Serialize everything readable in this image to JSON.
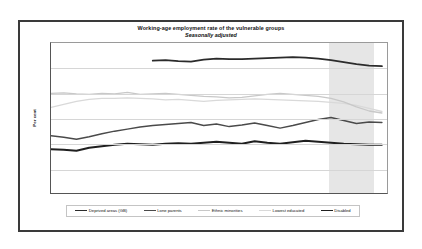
{
  "chart_data": {
    "type": "line",
    "title": "Working-age employment rate of the vulnerable groups",
    "subtitle": "Seasonally adjusted",
    "xlabel": "",
    "ylabel": "Per cent",
    "ylim": [
      40,
      70
    ],
    "yticks": [
      40,
      45,
      50,
      55,
      60,
      65,
      70
    ],
    "xlim": [
      2003.0,
      2009.6
    ],
    "xticks": [
      2003,
      2004,
      2005,
      2006,
      2007,
      2008,
      2009
    ],
    "xtick_labels": [
      "2003",
      "2004",
      "2005",
      "2006",
      "2007",
      "2008",
      "2009"
    ],
    "grid": true,
    "legend_position": "bottom",
    "shaded_region": {
      "label": "recession",
      "x_start": 2008.42,
      "x_end": 2009.3,
      "color": "#e6e6e6"
    },
    "series": [
      {
        "name": "Deprived areas (GB)",
        "color": "#2b2b2b",
        "width": 1.9,
        "x": [
          2005.0,
          2005.25,
          2005.5,
          2005.75,
          2006.0,
          2006.25,
          2006.5,
          2006.75,
          2007.0,
          2007.25,
          2007.5,
          2007.75,
          2008.0,
          2008.25,
          2008.5,
          2008.75,
          2009.0,
          2009.25,
          2009.5
        ],
        "values": [
          66.5,
          66.6,
          66.4,
          66.3,
          66.7,
          66.9,
          66.8,
          66.8,
          66.9,
          67.0,
          67.1,
          67.2,
          67.1,
          66.9,
          66.6,
          66.2,
          65.8,
          65.5,
          65.4
        ]
      },
      {
        "name": "Lone parents",
        "color": "#4a4a4a",
        "width": 1.5,
        "x": [
          2003.0,
          2003.25,
          2003.5,
          2003.75,
          2004.0,
          2004.25,
          2004.5,
          2004.75,
          2005.0,
          2005.25,
          2005.5,
          2005.75,
          2006.0,
          2006.25,
          2006.5,
          2006.75,
          2007.0,
          2007.25,
          2007.5,
          2007.75,
          2008.0,
          2008.25,
          2008.5,
          2008.75,
          2009.0,
          2009.25,
          2009.5
        ],
        "values": [
          51.6,
          51.3,
          50.9,
          51.4,
          52.0,
          52.5,
          52.9,
          53.3,
          53.6,
          53.8,
          54.0,
          54.2,
          53.6,
          53.9,
          53.4,
          53.7,
          54.1,
          53.6,
          53.1,
          53.6,
          54.2,
          54.8,
          55.2,
          54.6,
          54.0,
          54.3,
          54.2
        ]
      },
      {
        "name": "Ethnic minorities",
        "color": "#c8c8c8",
        "width": 1.3,
        "x": [
          2003.0,
          2003.25,
          2003.5,
          2003.75,
          2004.0,
          2004.25,
          2004.5,
          2004.75,
          2005.0,
          2005.25,
          2005.5,
          2005.75,
          2006.0,
          2006.25,
          2006.5,
          2006.75,
          2007.0,
          2007.25,
          2007.5,
          2007.75,
          2008.0,
          2008.25,
          2008.5,
          2008.75,
          2009.0,
          2009.25,
          2009.5
        ],
        "values": [
          60.0,
          60.1,
          59.9,
          59.8,
          60.0,
          59.9,
          60.2,
          59.8,
          59.9,
          60.0,
          59.8,
          59.6,
          59.4,
          59.3,
          59.1,
          59.2,
          59.5,
          59.8,
          60.0,
          59.8,
          59.6,
          59.4,
          59.0,
          58.3,
          57.3,
          56.5,
          56.1
        ]
      },
      {
        "name": "Lowest educated",
        "color": "#d9d9d9",
        "width": 1.3,
        "x": [
          2003.0,
          2003.25,
          2003.5,
          2003.75,
          2004.0,
          2004.25,
          2004.5,
          2004.75,
          2005.0,
          2005.25,
          2005.5,
          2005.75,
          2006.0,
          2006.25,
          2006.5,
          2006.75,
          2007.0,
          2007.25,
          2007.5,
          2007.75,
          2008.0,
          2008.25,
          2008.5,
          2008.75,
          2009.0,
          2009.25,
          2009.5
        ],
        "values": [
          57.2,
          57.8,
          58.4,
          58.8,
          59.0,
          59.0,
          59.1,
          59.0,
          58.9,
          58.7,
          58.8,
          58.6,
          58.4,
          58.6,
          58.7,
          58.8,
          58.9,
          58.8,
          58.7,
          58.6,
          58.5,
          58.4,
          58.2,
          58.0,
          57.6,
          57.0,
          56.4
        ]
      },
      {
        "name": "Disabled",
        "color": "#1f1f1f",
        "width": 1.9,
        "x": [
          2003.0,
          2003.25,
          2003.5,
          2003.75,
          2004.0,
          2004.25,
          2004.5,
          2004.75,
          2005.0,
          2005.25,
          2005.5,
          2005.75,
          2006.0,
          2006.25,
          2006.5,
          2006.75,
          2007.0,
          2007.25,
          2007.5,
          2007.75,
          2008.0,
          2008.25,
          2008.5,
          2008.75,
          2009.0,
          2009.25,
          2009.5
        ],
        "values": [
          48.9,
          48.8,
          48.6,
          49.2,
          49.5,
          49.8,
          50.0,
          49.9,
          49.8,
          50.0,
          50.1,
          50.0,
          50.2,
          50.4,
          50.2,
          50.0,
          50.5,
          50.2,
          50.0,
          50.3,
          50.6,
          50.4,
          50.2,
          50.0,
          49.9,
          49.8,
          49.8
        ]
      }
    ]
  }
}
